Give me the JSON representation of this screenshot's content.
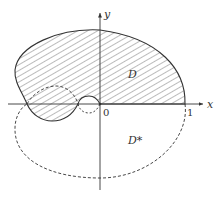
{
  "diagram": {
    "axes": {
      "x_label": "x",
      "y_label": "y",
      "origin_label": "0",
      "tick_labels": [
        "1"
      ]
    },
    "regions": [
      {
        "name": "D",
        "label": "D",
        "style": "hatched, solid boundary"
      },
      {
        "name": "D-star",
        "label": "D*",
        "style": "dashed boundary, unshaded"
      }
    ],
    "colors": {
      "stroke": "#333333",
      "hatch": "#555555",
      "background": "#ffffff"
    }
  }
}
